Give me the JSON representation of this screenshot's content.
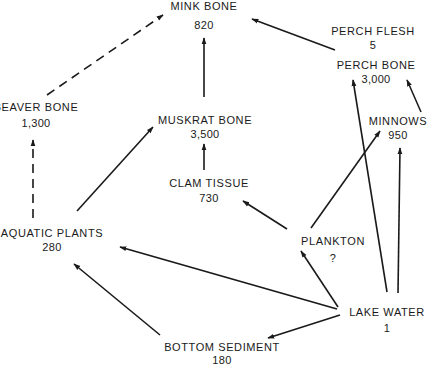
{
  "diagram": {
    "type": "food-web / concentration flow diagram",
    "nodes": [
      {
        "id": "mink",
        "label": "MINK BONE",
        "value": "820",
        "x": 204,
        "y": 10,
        "vy": 29
      },
      {
        "id": "perch_flesh",
        "label": "PERCH FLESH",
        "value": "5",
        "x": 373,
        "y": 35,
        "vy": 49
      },
      {
        "id": "perch_bone",
        "label": "PERCH BONE",
        "value": "3,000",
        "x": 376,
        "y": 69,
        "vy": 83
      },
      {
        "id": "beaver",
        "label": "BEAVER BONE",
        "value": "1,300",
        "x": 36,
        "y": 111,
        "vy": 127
      },
      {
        "id": "muskrat",
        "label": "MUSKRAT BONE",
        "value": "3,500",
        "x": 205,
        "y": 124,
        "vy": 138
      },
      {
        "id": "minnows",
        "label": "MINNOWS",
        "value": "950",
        "x": 398,
        "y": 125,
        "vy": 139
      },
      {
        "id": "clam",
        "label": "CLAM TISSUE",
        "value": "730",
        "x": 209,
        "y": 187,
        "vy": 202
      },
      {
        "id": "aquatic_plants",
        "label": "AQUATIC PLANTS",
        "value": "280",
        "x": 52,
        "y": 237,
        "vy": 251
      },
      {
        "id": "plankton",
        "label": "PLANKTON",
        "value": "?",
        "x": 333,
        "y": 245,
        "vy": 262
      },
      {
        "id": "lake_water",
        "label": "LAKE WATER",
        "value": "1",
        "x": 387,
        "y": 316,
        "vy": 332
      },
      {
        "id": "bottom_sediment",
        "label": "BOTTOM SEDIMENT",
        "value": "180",
        "x": 222,
        "y": 351,
        "vy": 364
      }
    ],
    "edges": [
      {
        "from": "beaver",
        "to": "mink",
        "style": "dashed",
        "x1": 47,
        "y1": 95,
        "x2": 163,
        "y2": 15
      },
      {
        "from": "aquatic_plants",
        "to": "beaver",
        "style": "dashed",
        "x1": 33,
        "y1": 218,
        "x2": 33,
        "y2": 140
      },
      {
        "from": "aquatic_plants",
        "to": "muskrat",
        "style": "solid",
        "x1": 77,
        "y1": 211,
        "x2": 153,
        "y2": 127
      },
      {
        "from": "muskrat",
        "to": "mink",
        "style": "solid",
        "x1": 204,
        "y1": 97,
        "x2": 204,
        "y2": 38
      },
      {
        "from": "perch_flesh",
        "to": "mink",
        "style": "solid",
        "x1": 335,
        "y1": 50,
        "x2": 252,
        "y2": 19
      },
      {
        "from": "clam",
        "to": "muskrat",
        "style": "solid",
        "x1": 204,
        "y1": 170,
        "x2": 204,
        "y2": 144
      },
      {
        "from": "plankton",
        "to": "clam",
        "style": "solid",
        "x1": 287,
        "y1": 229,
        "x2": 243,
        "y2": 201
      },
      {
        "from": "plankton",
        "to": "minnows",
        "style": "solid",
        "x1": 311,
        "y1": 228,
        "x2": 380,
        "y2": 131
      },
      {
        "from": "minnows",
        "to": "perch_bone",
        "style": "solid",
        "x1": 421,
        "y1": 112,
        "x2": 407,
        "y2": 80
      },
      {
        "from": "lake_water",
        "to": "perch_bone",
        "style": "solid",
        "x1": 387,
        "y1": 292,
        "x2": 353,
        "y2": 80
      },
      {
        "from": "lake_water",
        "to": "minnows",
        "style": "solid",
        "x1": 398,
        "y1": 293,
        "x2": 400,
        "y2": 148
      },
      {
        "from": "lake_water",
        "to": "plankton",
        "style": "solid",
        "x1": 338,
        "y1": 307,
        "x2": 301,
        "y2": 251
      },
      {
        "from": "lake_water",
        "to": "aquatic_plants",
        "style": "solid",
        "x1": 337,
        "y1": 309,
        "x2": 120,
        "y2": 247
      },
      {
        "from": "lake_water",
        "to": "bottom_sediment",
        "style": "solid",
        "x1": 340,
        "y1": 315,
        "x2": 268,
        "y2": 338
      },
      {
        "from": "bottom_sediment",
        "to": "aquatic_plants",
        "style": "solid",
        "x1": 160,
        "y1": 335,
        "x2": 74,
        "y2": 264
      }
    ]
  },
  "colors": {
    "ink": "#1a1a1a",
    "background": "#ffffff"
  }
}
